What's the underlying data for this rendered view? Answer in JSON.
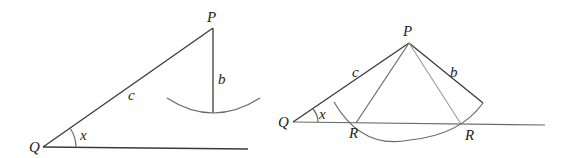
{
  "figures": [
    {
      "name": "left-figure",
      "labels": {
        "P": "P",
        "Q": "Q",
        "b": "b",
        "c": "c",
        "x": "x"
      },
      "points": {
        "Q": [
          43,
          147
        ],
        "P": [
          213,
          28
        ],
        "foot": [
          213,
          113
        ],
        "base_end": [
          248,
          149
        ]
      }
    },
    {
      "name": "right-figure",
      "labels": {
        "P": "P",
        "Q": "Q",
        "b": "b",
        "c": "c",
        "x": "x",
        "R1": "R",
        "R2": "R"
      },
      "points": {
        "Q": [
          293,
          122
        ],
        "P": [
          409,
          43
        ],
        "R1": [
          356,
          123
        ],
        "R2": [
          461,
          124
        ],
        "b_end": [
          483,
          103
        ],
        "base_end": [
          545,
          125
        ]
      }
    }
  ],
  "colors": {
    "line": "#3a3a3a",
    "secondary": "#6a6a6a",
    "light": "#9a9a9a",
    "text": "#222222"
  }
}
